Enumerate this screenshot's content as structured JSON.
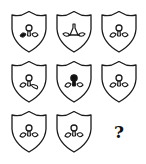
{
  "puzzle": {
    "title": "",
    "grid": {
      "rows": 3,
      "cols": 3
    },
    "stroke_color": "#1a1a1a",
    "fill_color": "#111111",
    "cells": [
      {
        "row": 1,
        "col": 1,
        "type": "shield",
        "bulb": "outline",
        "left_leaf": "filled",
        "right_leaf": "outline",
        "variant": "left-leaf-filled"
      },
      {
        "row": 1,
        "col": 2,
        "type": "shield",
        "bulb": "flask-outline",
        "left_leaf": "outline-outward",
        "right_leaf": "outline-outward",
        "variant": "flask-bulb-leaves-flipped"
      },
      {
        "row": 1,
        "col": 3,
        "type": "shield",
        "bulb": "outline",
        "left_leaf": "outline",
        "right_leaf": "outline",
        "variant": "standard"
      },
      {
        "row": 2,
        "col": 1,
        "type": "shield",
        "bulb": "outline",
        "left_leaf": "outline",
        "right_leaf": "outline-rotated-down",
        "variant": "right-leaf-rotated"
      },
      {
        "row": 2,
        "col": 2,
        "type": "shield",
        "bulb": "filled",
        "left_leaf": "outline",
        "right_leaf": "outline",
        "variant": "bulb-filled"
      },
      {
        "row": 2,
        "col": 3,
        "type": "shield",
        "bulb": "outline",
        "left_leaf": "outline",
        "right_leaf": "outline",
        "variant": "standard"
      },
      {
        "row": 3,
        "col": 1,
        "type": "shield",
        "bulb": "outline",
        "left_leaf": "outline",
        "right_leaf": "outline",
        "variant": "standard"
      },
      {
        "row": 3,
        "col": 2,
        "type": "shield",
        "bulb": "outline",
        "left_leaf": "outline",
        "right_leaf": "outline",
        "variant": "standard"
      },
      {
        "row": 3,
        "col": 3,
        "type": "question",
        "label": "?"
      }
    ]
  }
}
